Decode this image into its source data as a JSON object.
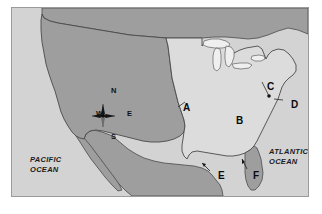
{
  "figure": {
    "kind": "reference-map"
  },
  "frame": {
    "border_color": "#9a9a9a",
    "plate_color": "#d3d3d3"
  },
  "palette": {
    "land_dark": "#9e9e9e",
    "land_light": "#dcdcdc",
    "lakes": "#efefef",
    "ocean": "#d3d3d3",
    "outline": "#4a4a4a",
    "label_text": "#0a0a0a"
  },
  "compass": {
    "name": "compass-rose",
    "north": "N",
    "south": "S",
    "west": "W",
    "east": "E"
  },
  "ocean_labels": [
    {
      "id": "pacific",
      "text": "PACIFIC\nOCEAN",
      "position": "west"
    },
    {
      "id": "atlantic",
      "text": "ATLANTIC\nOCEAN",
      "position": "east"
    }
  ],
  "point_labels": [
    {
      "id": "a",
      "text": "A",
      "has_leader": true
    },
    {
      "id": "b",
      "text": "B",
      "has_leader": false
    },
    {
      "id": "c",
      "text": "C",
      "has_leader": true
    },
    {
      "id": "d",
      "text": "D",
      "has_leader": true
    },
    {
      "id": "e",
      "text": "E",
      "has_leader": true
    },
    {
      "id": "f",
      "text": "F",
      "has_leader": true
    }
  ]
}
